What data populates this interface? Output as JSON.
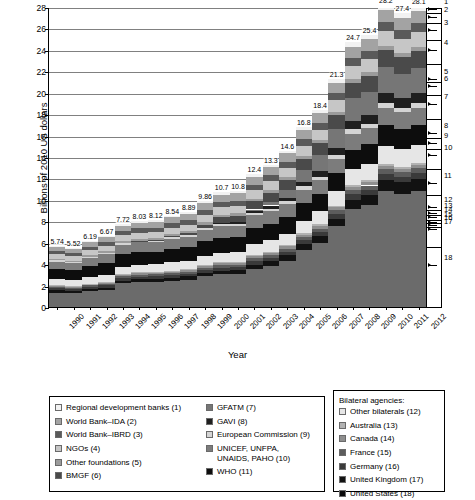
{
  "chart_data": {
    "type": "bar",
    "stacked": true,
    "title": "",
    "xlabel": "Year",
    "ylabel": "Billions of 2010 US dollars",
    "ylim": [
      0,
      28
    ],
    "ytick_step": 2,
    "yticks": [
      0,
      2,
      4,
      6,
      8,
      10,
      12,
      14,
      16,
      18,
      20,
      22,
      24,
      26,
      28
    ],
    "grid": true,
    "legend_position": "bottom",
    "categories": [
      "1990",
      "1991",
      "1992",
      "1993",
      "1994",
      "1995",
      "1996",
      "1997",
      "1998",
      "1999",
      "2000",
      "2001",
      "2002",
      "2003",
      "2004",
      "2005",
      "2006",
      "2007",
      "2008",
      "2009",
      "2010",
      "2011",
      "2012"
    ],
    "totals": [
      5.74,
      5.52,
      6.19,
      6.67,
      7.72,
      8.03,
      8.12,
      8.54,
      8.89,
      9.86,
      10.7,
      10.8,
      12.4,
      13.3,
      14.6,
      16.8,
      18.4,
      21.3,
      24.7,
      25.4,
      28.2,
      27.4,
      28.1
    ],
    "total_labels": [
      "5.74",
      "5.52",
      "6.19",
      "6.67",
      "7.72",
      "8.03",
      "8.12",
      "8.54",
      "8.89",
      "9.86",
      "10.7",
      "10.8",
      "12.4",
      "13.3",
      "14.6",
      "16.8",
      "18.4",
      "21.3",
      "24.7",
      "25.4",
      "28.2",
      "27.4",
      "28.1"
    ],
    "series": [
      {
        "name": "United States (18)",
        "number": 18,
        "color": "#6b6b6b",
        "values": [
          1.35,
          1.3,
          1.42,
          1.5,
          2.1,
          2.22,
          2.22,
          2.3,
          2.38,
          2.62,
          2.82,
          2.88,
          3.3,
          3.7,
          4.4,
          5.6,
          6.6,
          8.6,
          10.6,
          11.2,
          12.9,
          12.7,
          13.1
        ]
      },
      {
        "name": "United Kingdom (17)",
        "number": 17,
        "color": "#121212",
        "values": [
          0.2,
          0.18,
          0.2,
          0.22,
          0.25,
          0.26,
          0.26,
          0.27,
          0.28,
          0.3,
          0.33,
          0.34,
          0.4,
          0.44,
          0.5,
          0.62,
          0.7,
          0.84,
          1.0,
          1.06,
          1.22,
          1.25,
          1.3
        ]
      },
      {
        "name": "Germany (16)",
        "number": 16,
        "color": "#3a3a3a",
        "values": [
          0.18,
          0.17,
          0.18,
          0.19,
          0.21,
          0.22,
          0.22,
          0.23,
          0.23,
          0.25,
          0.26,
          0.26,
          0.3,
          0.32,
          0.35,
          0.4,
          0.44,
          0.5,
          0.58,
          0.6,
          0.68,
          0.66,
          0.68
        ]
      },
      {
        "name": "France (15)",
        "number": 15,
        "color": "#5c5c5c",
        "values": [
          0.14,
          0.13,
          0.14,
          0.15,
          0.16,
          0.17,
          0.17,
          0.18,
          0.18,
          0.19,
          0.2,
          0.2,
          0.23,
          0.25,
          0.27,
          0.31,
          0.34,
          0.38,
          0.44,
          0.46,
          0.52,
          0.5,
          0.52
        ]
      },
      {
        "name": "Canada (14)",
        "number": 14,
        "color": "#8e8e8e",
        "values": [
          0.11,
          0.1,
          0.11,
          0.12,
          0.13,
          0.13,
          0.13,
          0.14,
          0.14,
          0.15,
          0.16,
          0.16,
          0.18,
          0.19,
          0.21,
          0.24,
          0.27,
          0.3,
          0.34,
          0.36,
          0.41,
          0.4,
          0.41
        ]
      },
      {
        "name": "Australia (13)",
        "number": 13,
        "color": "#b2b2b2",
        "values": [
          0.06,
          0.06,
          0.06,
          0.07,
          0.07,
          0.07,
          0.07,
          0.08,
          0.08,
          0.08,
          0.09,
          0.09,
          0.1,
          0.11,
          0.12,
          0.13,
          0.15,
          0.17,
          0.19,
          0.2,
          0.23,
          0.22,
          0.23
        ]
      },
      {
        "name": "Other bilaterals (12)",
        "number": 12,
        "color": "#e6e6e6",
        "values": [
          0.55,
          0.52,
          0.57,
          0.6,
          0.66,
          0.68,
          0.68,
          0.71,
          0.73,
          0.79,
          0.84,
          0.84,
          0.95,
          1.02,
          1.1,
          1.25,
          1.36,
          1.55,
          1.78,
          1.82,
          2.02,
          1.96,
          2.0
        ]
      },
      {
        "name": "WHO (11)",
        "number": 11,
        "color": "#0d0d0d",
        "values": [
          0.95,
          0.92,
          1.0,
          1.05,
          1.12,
          1.14,
          1.14,
          1.17,
          1.2,
          1.26,
          1.3,
          1.3,
          1.42,
          1.48,
          1.56,
          1.7,
          1.78,
          1.92,
          2.08,
          2.12,
          2.28,
          2.22,
          2.26
        ]
      },
      {
        "name": "UNICEF, UNFPA, UNAIDS, PAHO (10)",
        "number": 10,
        "color": "#7c7c7c",
        "values": [
          0.7,
          0.67,
          0.73,
          0.77,
          0.83,
          0.85,
          0.85,
          0.88,
          0.9,
          0.96,
          1.0,
          1.0,
          1.1,
          1.16,
          1.24,
          1.36,
          1.44,
          1.58,
          1.74,
          1.78,
          1.94,
          1.9,
          1.93
        ]
      },
      {
        "name": "European Commission (9)",
        "number": 9,
        "color": "#d4d4d4",
        "values": [
          0.12,
          0.11,
          0.12,
          0.13,
          0.14,
          0.15,
          0.15,
          0.16,
          0.16,
          0.18,
          0.19,
          0.19,
          0.22,
          0.24,
          0.27,
          0.31,
          0.35,
          0.4,
          0.46,
          0.48,
          0.54,
          0.52,
          0.54
        ]
      },
      {
        "name": "GAVI (8)",
        "number": 8,
        "color": "#1f1f1f",
        "values": [
          0.0,
          0.0,
          0.0,
          0.0,
          0.0,
          0.0,
          0.0,
          0.0,
          0.0,
          0.0,
          0.1,
          0.14,
          0.22,
          0.28,
          0.34,
          0.44,
          0.56,
          0.74,
          0.9,
          0.96,
          1.12,
          1.08,
          1.12
        ]
      },
      {
        "name": "GFATM (7)",
        "number": 7,
        "color": "#767676",
        "values": [
          0.0,
          0.0,
          0.0,
          0.0,
          0.0,
          0.0,
          0.0,
          0.0,
          0.0,
          0.0,
          0.0,
          0.0,
          0.08,
          0.32,
          0.72,
          1.22,
          1.62,
          2.05,
          2.45,
          2.55,
          2.85,
          2.7,
          2.8
        ]
      },
      {
        "name": "BMGF (6)",
        "number": 6,
        "color": "#4a4a4a",
        "values": [
          0.0,
          0.0,
          0.0,
          0.0,
          0.0,
          0.02,
          0.04,
          0.08,
          0.14,
          0.3,
          0.5,
          0.58,
          0.7,
          0.82,
          0.94,
          1.1,
          1.26,
          1.46,
          1.66,
          1.72,
          1.92,
          1.88,
          1.94
        ]
      },
      {
        "name": "Other foundations (5)",
        "number": 5,
        "color": "#9b9b9b",
        "values": [
          0.14,
          0.13,
          0.14,
          0.15,
          0.16,
          0.17,
          0.17,
          0.18,
          0.18,
          0.19,
          0.2,
          0.2,
          0.22,
          0.24,
          0.26,
          0.29,
          0.32,
          0.36,
          0.4,
          0.42,
          0.46,
          0.45,
          0.46
        ]
      },
      {
        "name": "NGOs (4)",
        "number": 4,
        "color": "#c6c6c6",
        "values": [
          0.42,
          0.4,
          0.44,
          0.47,
          0.52,
          0.54,
          0.54,
          0.56,
          0.58,
          0.62,
          0.66,
          0.66,
          0.74,
          0.8,
          0.86,
          0.98,
          1.08,
          1.22,
          1.4,
          1.44,
          1.6,
          1.56,
          1.6
        ]
      },
      {
        "name": "World Bank–IBRD (3)",
        "number": 3,
        "color": "#5a5a5a",
        "values": [
          0.3,
          0.29,
          0.31,
          0.33,
          0.36,
          0.37,
          0.37,
          0.39,
          0.4,
          0.42,
          0.45,
          0.45,
          0.5,
          0.54,
          0.58,
          0.64,
          0.7,
          0.78,
          0.88,
          0.9,
          1.0,
          0.98,
          1.0
        ]
      },
      {
        "name": "World Bank–IDA (2)",
        "number": 2,
        "color": "#a3a3a3",
        "values": [
          0.4,
          0.38,
          0.42,
          0.45,
          0.49,
          0.51,
          0.51,
          0.53,
          0.55,
          0.58,
          0.62,
          0.62,
          0.7,
          0.75,
          0.81,
          0.9,
          0.98,
          1.1,
          1.24,
          1.28,
          1.42,
          1.38,
          1.42
        ]
      },
      {
        "name": "Regional development banks (1)",
        "number": 1,
        "color": "#f2f2f2",
        "values": [
          0.12,
          0.11,
          0.12,
          0.13,
          0.14,
          0.15,
          0.15,
          0.16,
          0.16,
          0.18,
          0.19,
          0.19,
          0.22,
          0.24,
          0.27,
          0.31,
          0.35,
          0.4,
          0.46,
          0.48,
          0.54,
          0.52,
          0.54
        ]
      }
    ],
    "right_axis_markers": [
      {
        "label": "1",
        "value": 27.9
      },
      {
        "label": "2",
        "value": 27.2
      },
      {
        "label": "3",
        "value": 25.95
      },
      {
        "label": "4",
        "value": 24.1
      },
      {
        "label": "5",
        "value": 21.4
      },
      {
        "label": "6",
        "value": 20.7
      },
      {
        "label": "7",
        "value": 19.05
      },
      {
        "label": "8",
        "value": 16.3
      },
      {
        "label": "9",
        "value": 15.4
      },
      {
        "label": "10",
        "value": 14.25
      },
      {
        "label": "11",
        "value": 11.7
      },
      {
        "label": "12",
        "value": 9.45
      },
      {
        "label": "13",
        "value": 8.85
      },
      {
        "label": "14",
        "value": 8.45
      },
      {
        "label": "15",
        "value": 8.05
      },
      {
        "label": "16",
        "value": 7.75
      },
      {
        "label": "17",
        "value": 7.4
      },
      {
        "label": "18",
        "value": 4.05
      }
    ]
  },
  "legend": {
    "column1": [
      {
        "label": "Regional development banks (1)",
        "color": "#f2f2f2"
      },
      {
        "label": "World Bank–IDA (2)",
        "color": "#a3a3a3"
      },
      {
        "label": "World Bank–IBRD (3)",
        "color": "#5a5a5a"
      },
      {
        "label": "NGOs (4)",
        "color": "#c6c6c6"
      },
      {
        "label": "Other foundations (5)",
        "color": "#9b9b9b"
      },
      {
        "label": "BMGF (6)",
        "color": "#4a4a4a"
      }
    ],
    "column2": [
      {
        "label": "GFATM (7)",
        "color": "#767676"
      },
      {
        "label": "GAVI (8)",
        "color": "#1f1f1f"
      },
      {
        "label": "European Commission (9)",
        "color": "#d4d4d4"
      },
      {
        "label": "UNICEF, UNFPA,\nUNAIDS, PAHO (10)",
        "color": "#7c7c7c"
      },
      {
        "label": "WHO (11)",
        "color": "#0d0d0d"
      }
    ],
    "bilateral": {
      "heading": "Bilateral agencies:",
      "items": [
        {
          "label": "Other bilaterals (12)",
          "color": "#e6e6e6"
        },
        {
          "label": "Australia (13)",
          "color": "#b2b2b2"
        },
        {
          "label": "Canada (14)",
          "color": "#8e8e8e"
        },
        {
          "label": "France (15)",
          "color": "#5c5c5c"
        },
        {
          "label": "Germany (16)",
          "color": "#3a3a3a"
        },
        {
          "label": "United Kingdom (17)",
          "color": "#121212"
        },
        {
          "label": "United States (18)",
          "color": "#0a0a0a"
        }
      ]
    }
  }
}
